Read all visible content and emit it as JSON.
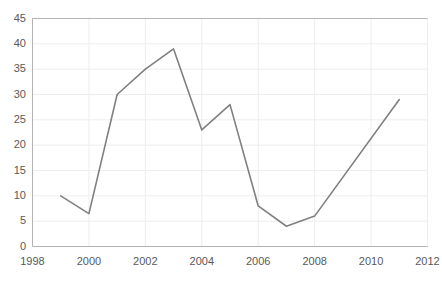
{
  "chart_data": {
    "type": "line",
    "title": "",
    "xlabel": "",
    "ylabel": "",
    "x": [
      1999,
      2000,
      2001,
      2002,
      2003,
      2004,
      2005,
      2006,
      2007,
      2008,
      2011
    ],
    "values": [
      10,
      6.5,
      30,
      35,
      39,
      23,
      28,
      8,
      4,
      6,
      29
    ],
    "series": [
      {
        "name": "series-1",
        "x": [
          1999,
          2000,
          2001,
          2002,
          2003,
          2004,
          2005,
          2006,
          2007,
          2008,
          2011
        ],
        "values": [
          10,
          6.5,
          30,
          35,
          39,
          23,
          28,
          8,
          4,
          6,
          29
        ],
        "color": "#808080"
      }
    ],
    "xlim": [
      1998,
      2012
    ],
    "ylim": [
      0,
      45
    ],
    "xticks": [
      1998,
      2000,
      2002,
      2004,
      2006,
      2008,
      2010,
      2012
    ],
    "xticklabels": [
      "1998",
      "2000",
      "2002",
      "2004",
      "2006",
      "2008",
      "2010",
      "2012"
    ],
    "yticks": [
      0,
      5,
      10,
      15,
      20,
      25,
      30,
      35,
      40,
      45
    ],
    "yticklabels": [
      "0",
      "5",
      "10",
      "15",
      "20",
      "25",
      "30",
      "35",
      "40",
      "45"
    ],
    "grid": "horizontal-and-vertical",
    "legend": "none",
    "markers": false,
    "line_color": "#808080",
    "grid_color": "#ededed",
    "axis_color": "#b3b3b3",
    "tick_label_color": "#595959",
    "background": "#ffffff"
  }
}
